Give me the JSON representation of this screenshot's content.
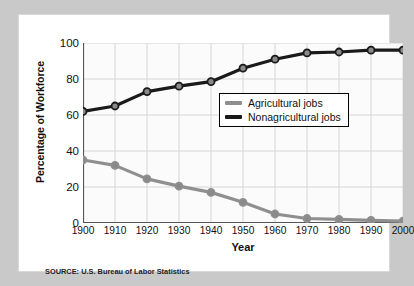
{
  "figure": {
    "ylabel": "Percentage of Workforce",
    "xlabel": "Year",
    "source": "SOURCE: U.S. Bureau of Labor Statistics"
  },
  "legend": {
    "items": [
      {
        "label": "Agricultural jobs",
        "color": "#8f8f8f"
      },
      {
        "label": "Nonagricultural jobs",
        "color": "#1a1a1a"
      }
    ]
  },
  "chart_data": {
    "type": "line",
    "title": "",
    "xlabel": "Year",
    "ylabel": "Percentage of Workforce",
    "x": [
      1900,
      1910,
      1920,
      1930,
      1940,
      1950,
      1960,
      1970,
      1980,
      1990,
      2000
    ],
    "xticklabels": [
      "1900",
      "1910",
      "1920",
      "1930",
      "1940",
      "1950",
      "1960",
      "1970",
      "1980",
      "1990",
      "2000"
    ],
    "yticklabels": [
      "0",
      "20",
      "40",
      "60",
      "80",
      "100"
    ],
    "yticks": [
      0,
      20,
      40,
      60,
      80,
      100
    ],
    "xlim": [
      1900,
      2000
    ],
    "ylim": [
      0,
      100
    ],
    "grid": true,
    "legend_position": "center-right",
    "series": [
      {
        "name": "Agricultural jobs",
        "color": "#8f8f8f",
        "marker": "circle",
        "values": [
          35,
          32,
          24.5,
          20.5,
          17,
          11.5,
          5,
          2.5,
          2,
          1.5,
          1
        ]
      },
      {
        "name": "Nonagricultural jobs",
        "color": "#1a1a1a",
        "marker": "circle",
        "values": [
          62,
          65,
          73,
          76,
          78.5,
          86,
          91,
          94.5,
          95,
          96,
          96
        ]
      }
    ]
  }
}
